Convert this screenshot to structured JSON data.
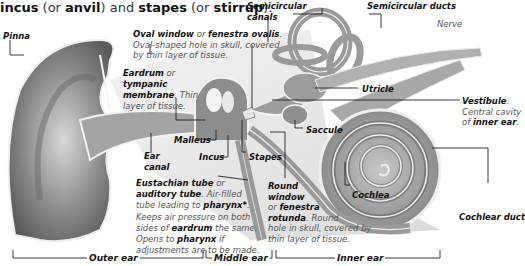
{
  "header": {
    "parts": [
      {
        "text": "incus",
        "bold": true
      },
      {
        "text": " (or ",
        "bold": false
      },
      {
        "text": "anvil",
        "bold": true
      },
      {
        "text": ") and ",
        "bold": false
      },
      {
        "text": "stapes",
        "bold": true
      },
      {
        "text": " (or ",
        "bold": false
      },
      {
        "text": "stirrup",
        "bold": true
      },
      {
        "text": ").",
        "bold": false
      }
    ]
  },
  "labels": {
    "pinna": "Pinna",
    "oval_window": {
      "term": "Oval window",
      "or": " or ",
      "alt": "fenestra ovalis",
      "desc1": "Oval-shaped hole in skull, covered",
      "desc2": "by thin layer of tissue."
    },
    "eardrum": {
      "term": "Eardrum",
      "or": " or",
      "alt1": "tympanic",
      "alt2": "membrane",
      "desc1": ". Thin",
      "desc2": "layer of tissue."
    },
    "semicircular_canals": {
      "l1": "Semicircular",
      "l2": "canals"
    },
    "semicircular_ducts": "Semicircular ducts",
    "nerve": "Nerve",
    "utricle": "Utricle",
    "vestibule": {
      "term": "Vestibule",
      "desc1": "Central cavity",
      "desc2": "of ",
      "desc3": "inner ear"
    },
    "saccule": "Saccule",
    "malleus": "Malleus",
    "incus": "Incus",
    "stapes": "Stapes",
    "ear_canal": {
      "l1": "Ear",
      "l2": "canal"
    },
    "eustachian": {
      "term": "Eustachian tube",
      "or": " or",
      "alt": "auditory tube",
      "d1": " Air-filled",
      "d2a": "tube leading to ",
      "d2b": "pharynx*",
      "d3": "Keeps air pressure on both",
      "d4a": "sides of ",
      "d4b": "eardrum",
      "d4c": " the same.",
      "d5a": "Opens to ",
      "d5b": "pharynx",
      "d5c": " if",
      "d6": "adjustments are to be made."
    },
    "round_window": {
      "l1": "Round",
      "l2": "window",
      "l3a": "or ",
      "l3b": "fenestra",
      "l4a": "rotunda",
      "l4b": ". Round",
      "d1": "hole in skull, covered by",
      "d2": "thin layer of tissue."
    },
    "cochlea": "Cochlea",
    "cochlear_duct": "Cochlear duct"
  },
  "sections": {
    "outer": "Outer ear",
    "middle": "Middle ear",
    "inner": "Inner ear"
  },
  "colors": {
    "tissue": "#9a9a9a",
    "tissue_light": "#cfcfcf",
    "outline": "#f4f4f4",
    "leader": "#222222"
  }
}
